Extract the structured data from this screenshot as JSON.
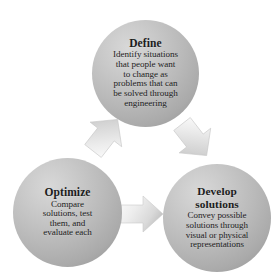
{
  "diagram": {
    "type": "cycle",
    "background_color": "#ffffff",
    "node_fill_light": "#d8d8d8",
    "node_fill_dark": "#8f8f8f",
    "arrow_fill": "#e3e3e3",
    "text_color": "#1c1c1c",
    "top_cut_title": "",
    "nodes": [
      {
        "id": "define",
        "heading": "Define",
        "body_lines": [
          "Identify situations",
          "that people want",
          "to change as",
          "problems that can",
          "be solved through",
          "engineering"
        ],
        "body": "Identify situations that people want to change as problems that can be solved through engineering",
        "position": "top-center"
      },
      {
        "id": "optimize",
        "heading": "Optimize",
        "body_lines": [
          "Compare",
          "solutions, test",
          "them, and",
          "evaluate each"
        ],
        "body": "Compare solutions, test them, and evaluate each",
        "position": "bottom-left"
      },
      {
        "id": "develop",
        "heading": "Develop\nsolutions",
        "heading_line1": "Develop",
        "heading_line2": "solutions",
        "body_lines": [
          "Convey possible",
          "solutions through",
          "visual or physical",
          "representations"
        ],
        "body": "Convey possible solutions through visual or physical representations",
        "position": "bottom-right"
      }
    ],
    "arrows": [
      {
        "id": "optimize-to-define",
        "from": "optimize",
        "to": "define",
        "direction": "up-right",
        "label": ""
      },
      {
        "id": "define-to-develop",
        "from": "define",
        "to": "develop",
        "direction": "down-right",
        "label": ""
      },
      {
        "id": "optimize-to-develop",
        "from": "optimize",
        "to": "develop",
        "direction": "right",
        "label": ""
      }
    ]
  }
}
